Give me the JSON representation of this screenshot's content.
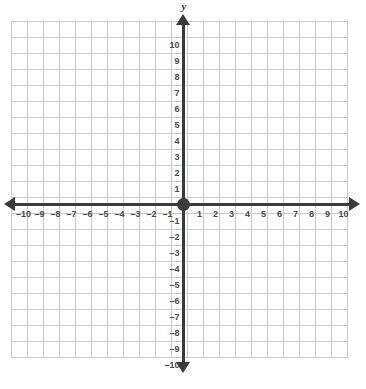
{
  "graph": {
    "title": "Cartesian coordinate plane",
    "y_axis_title": "y",
    "x_axis_title": "",
    "origin_marker": "origin-dot"
  },
  "colors": {
    "grid": "#c9c9c9",
    "axis": "#3a3a3a",
    "label": "#4a4a4a",
    "background": "#ffffff"
  },
  "chart_data": {
    "type": "scatter",
    "title": "",
    "xlabel": "",
    "ylabel": "y",
    "xlim": [
      -10,
      10
    ],
    "ylim": [
      -10,
      10
    ],
    "grid": true,
    "legend": null,
    "x_ticks": [
      -10,
      -9,
      -8,
      -7,
      -6,
      -5,
      -4,
      -3,
      -2,
      -1,
      1,
      2,
      3,
      4,
      5,
      6,
      7,
      8,
      9,
      10
    ],
    "y_ticks": [
      10,
      9,
      8,
      7,
      6,
      5,
      4,
      3,
      2,
      1,
      -1,
      -2,
      -3,
      -4,
      -5,
      -6,
      -7,
      -8,
      -9,
      -10
    ],
    "x_tick_labels": [
      "–10",
      "–9",
      "–8",
      "–7",
      "–6",
      "–5",
      "–4",
      "–3",
      "–2",
      "–1",
      "1",
      "2",
      "3",
      "4",
      "5",
      "6",
      "7",
      "8",
      "9",
      "10"
    ],
    "y_tick_labels": [
      "10",
      "9",
      "8",
      "7",
      "6",
      "5",
      "4",
      "3",
      "2",
      "1",
      "–1",
      "–2",
      "–3",
      "–4",
      "–5",
      "–6",
      "–7",
      "–8",
      "–9",
      "–10"
    ],
    "series": [],
    "values": [],
    "annotations": [
      {
        "label": "origin point",
        "x": 0,
        "y": 0
      }
    ]
  }
}
